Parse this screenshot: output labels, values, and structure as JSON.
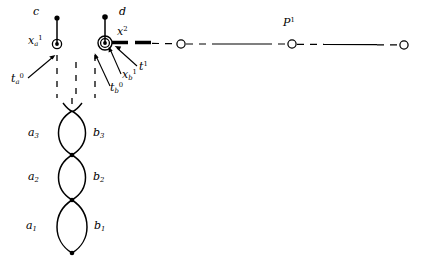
{
  "figure": {
    "type": "mathematical-diagram",
    "background_color": "#ffffff",
    "stroke_color": "#000000"
  },
  "labels": {
    "c": "c",
    "d": "d",
    "x_a_1": {
      "base": "x",
      "sub": "a",
      "sup": "1"
    },
    "x_2": {
      "base": "x",
      "sub": "",
      "sup": "2"
    },
    "t_a_0": {
      "base": "t",
      "sub": "a",
      "sup": "0"
    },
    "t_b_0": {
      "base": "t",
      "sub": "b",
      "sup": "0"
    },
    "x_b_1": {
      "base": "x",
      "sub": "b",
      "sup": "1"
    },
    "t_1": {
      "base": "t",
      "sub": "",
      "sup": "1"
    },
    "P_1": {
      "base": "P",
      "sub": "",
      "sup": "1"
    },
    "a3": {
      "base": "a",
      "sub": "3",
      "sup": ""
    },
    "b3": {
      "base": "b",
      "sub": "3",
      "sup": ""
    },
    "a2": {
      "base": "a",
      "sub": "2",
      "sup": ""
    },
    "b2": {
      "base": "b",
      "sub": "2",
      "sup": ""
    },
    "a1": {
      "base": "a",
      "sub": "1",
      "sup": ""
    },
    "b1": {
      "base": "b",
      "sub": "1",
      "sup": ""
    }
  },
  "geometry": {
    "vertex_a": {
      "x": 57,
      "y": 44
    },
    "vertex_b": {
      "x": 105,
      "y": 43
    },
    "top_dot_c": {
      "x": 57,
      "y": 18
    },
    "top_dot_d": {
      "x": 105,
      "y": 17
    },
    "path_circles": [
      {
        "x": 181,
        "y": 44
      },
      {
        "x": 292,
        "y": 44
      },
      {
        "x": 404,
        "y": 45
      }
    ],
    "loop_nodes": [
      {
        "x": 72,
        "y": 111
      },
      {
        "x": 72,
        "y": 155
      },
      {
        "x": 72,
        "y": 200
      },
      {
        "x": 72,
        "y": 253
      }
    ]
  }
}
